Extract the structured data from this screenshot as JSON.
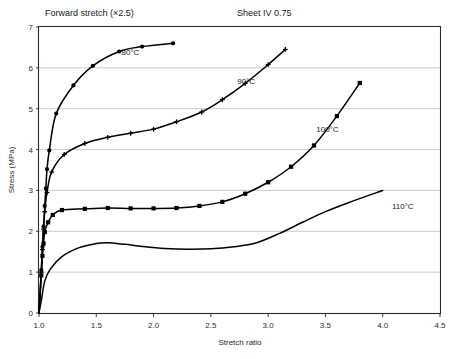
{
  "header": {
    "left_note": "Forward stretch (×2.5)",
    "right_note": "Sheet IV 0.75"
  },
  "chart_data": {
    "type": "line",
    "title": "",
    "subtitle": "",
    "xlabel": "Stretch ratio",
    "ylabel": "Stress (MPa)",
    "xlim": [
      1.0,
      4.5
    ],
    "ylim": [
      0,
      7
    ],
    "xticks": [
      "1.0",
      "1.5",
      "2.0",
      "2.5",
      "3.0",
      "3.5",
      "4.0",
      "4.5"
    ],
    "xtick_values": [
      1.0,
      1.5,
      2.0,
      2.5,
      3.0,
      3.5,
      4.0,
      4.5
    ],
    "yticks": [
      "0",
      "1",
      "2",
      "3",
      "4",
      "5",
      "6",
      "7"
    ],
    "ytick_values": [
      0,
      1,
      2,
      3,
      4,
      5,
      6,
      7
    ],
    "grid": "horizontal",
    "legend_position": "inline-annotations",
    "series": [
      {
        "name": "80°C",
        "label": "80°C",
        "marker": "circle",
        "color": "#000000",
        "label_x": 1.72,
        "label_y": 6.32,
        "points": [
          [
            1.0,
            0.0
          ],
          [
            1.02,
            1.05
          ],
          [
            1.03,
            1.62
          ],
          [
            1.04,
            2.12
          ],
          [
            1.05,
            2.62
          ],
          [
            1.06,
            3.05
          ],
          [
            1.07,
            3.52
          ],
          [
            1.09,
            3.98
          ],
          [
            1.15,
            4.88
          ],
          [
            1.3,
            5.57
          ],
          [
            1.47,
            6.05
          ],
          [
            1.7,
            6.4
          ],
          [
            1.9,
            6.52
          ],
          [
            2.17,
            6.6
          ]
        ]
      },
      {
        "name": "90°C",
        "label": "90°C",
        "marker": "cross",
        "color": "#000000",
        "label_x": 2.73,
        "label_y": 5.6,
        "points": [
          [
            1.0,
            0.0
          ],
          [
            1.02,
            1.0
          ],
          [
            1.03,
            1.55
          ],
          [
            1.04,
            2.05
          ],
          [
            1.05,
            2.48
          ],
          [
            1.07,
            2.95
          ],
          [
            1.11,
            3.45
          ],
          [
            1.22,
            3.88
          ],
          [
            1.4,
            4.15
          ],
          [
            1.6,
            4.3
          ],
          [
            1.8,
            4.4
          ],
          [
            2.0,
            4.5
          ],
          [
            2.2,
            4.68
          ],
          [
            2.42,
            4.92
          ],
          [
            2.6,
            5.22
          ],
          [
            2.8,
            5.62
          ],
          [
            3.0,
            6.08
          ],
          [
            3.15,
            6.45
          ]
        ]
      },
      {
        "name": "100°C",
        "label": "100°C",
        "marker": "square",
        "color": "#000000",
        "label_x": 3.42,
        "label_y": 4.42,
        "points": [
          [
            1.0,
            0.0
          ],
          [
            1.02,
            0.92
          ],
          [
            1.03,
            1.4
          ],
          [
            1.04,
            1.7
          ],
          [
            1.05,
            1.98
          ],
          [
            1.08,
            2.22
          ],
          [
            1.12,
            2.4
          ],
          [
            1.2,
            2.52
          ],
          [
            1.4,
            2.55
          ],
          [
            1.6,
            2.57
          ],
          [
            1.8,
            2.56
          ],
          [
            2.0,
            2.56
          ],
          [
            2.2,
            2.57
          ],
          [
            2.4,
            2.62
          ],
          [
            2.6,
            2.72
          ],
          [
            2.8,
            2.92
          ],
          [
            3.0,
            3.2
          ],
          [
            3.2,
            3.58
          ],
          [
            3.4,
            4.1
          ],
          [
            3.6,
            4.82
          ],
          [
            3.8,
            5.63
          ]
        ]
      },
      {
        "name": "110°C",
        "label": "110°C",
        "marker": "none",
        "color": "#000000",
        "label_x": 4.08,
        "label_y": 2.55,
        "points": [
          [
            1.0,
            0.0
          ],
          [
            1.02,
            0.3
          ],
          [
            1.05,
            0.78
          ],
          [
            1.1,
            1.08
          ],
          [
            1.2,
            1.38
          ],
          [
            1.35,
            1.6
          ],
          [
            1.5,
            1.7
          ],
          [
            1.6,
            1.72
          ],
          [
            1.75,
            1.68
          ],
          [
            1.9,
            1.63
          ],
          [
            2.1,
            1.58
          ],
          [
            2.3,
            1.56
          ],
          [
            2.5,
            1.57
          ],
          [
            2.7,
            1.62
          ],
          [
            2.9,
            1.72
          ],
          [
            3.1,
            1.95
          ],
          [
            3.3,
            2.22
          ],
          [
            3.5,
            2.48
          ],
          [
            3.7,
            2.7
          ],
          [
            4.0,
            3.0
          ]
        ]
      }
    ]
  }
}
